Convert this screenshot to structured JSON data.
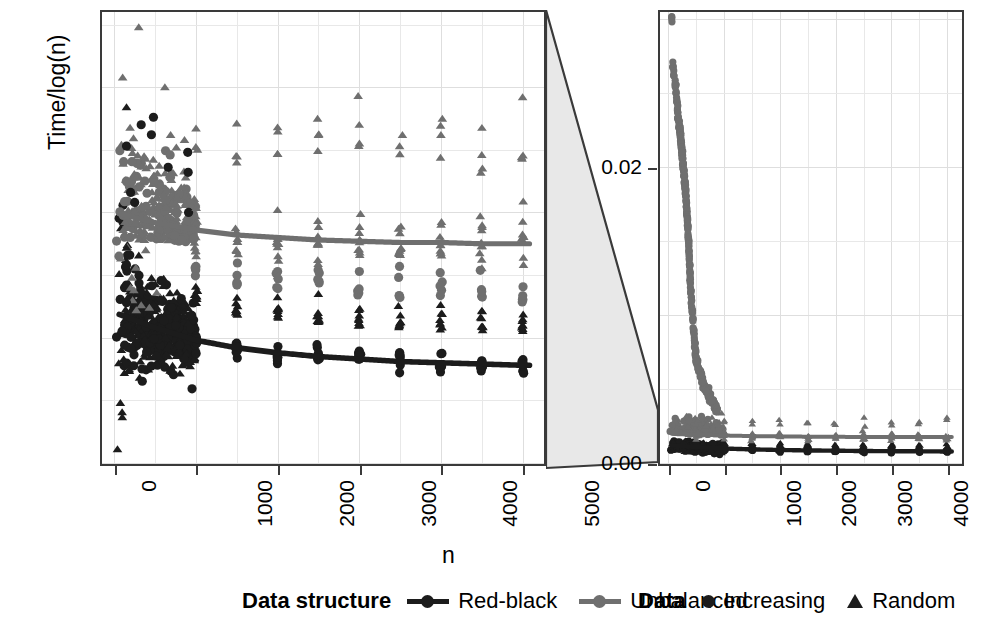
{
  "chart_data": {
    "type": "scatter",
    "title": "",
    "xlabel": "n",
    "ylabel": "Time/log(n)",
    "layout": "two-panel zoom (facet_zoom): left = magnified y-range, right = full y-range",
    "grid": true,
    "legend_position": "bottom",
    "panels": [
      {
        "name": "zoomed",
        "position": "left",
        "xlim": [
          -150,
          5250
        ],
        "ylim": [
          0,
          0.0036
        ],
        "xticks": [
          0,
          1000,
          2000,
          3000,
          4000,
          5000
        ],
        "xticklabels": [
          "0",
          "1000",
          "2000",
          "3000",
          "4000",
          "5000"
        ],
        "yticks": [],
        "yticklabels": []
      },
      {
        "name": "full",
        "position": "right",
        "xlim": [
          -150,
          5250
        ],
        "ylim": [
          0,
          0.0305
        ],
        "xticks": [
          0,
          1000,
          2000,
          3000,
          4000,
          5000
        ],
        "xticklabels": [
          "0",
          "1000",
          "2000",
          "3000",
          "4000",
          "5000"
        ],
        "yticks": [
          0.0,
          0.02
        ],
        "yticklabels": [
          "0.00",
          "0.02"
        ],
        "zoom_band": [
          0,
          0.0036
        ]
      }
    ],
    "series": [
      {
        "name": "Red-black / Increasing",
        "data_structure": "Red-black",
        "data": "Increasing",
        "color": "#1c1c1c",
        "marker": "circle",
        "trend_x": [
          0,
          500,
          1000,
          1500,
          2000,
          2500,
          3000,
          3500,
          4000,
          4500,
          5000
        ],
        "trend_y": [
          0.0012,
          0.00108,
          0.00098,
          0.00092,
          0.00088,
          0.00085,
          0.00083,
          0.00081,
          0.0008,
          0.00079,
          0.00078
        ]
      },
      {
        "name": "Red-black / Random",
        "data_structure": "Red-black",
        "data": "Random",
        "color": "#1c1c1c",
        "marker": "triangle"
      },
      {
        "name": "Unbalanced / Increasing",
        "data_structure": "Unbalanced",
        "data": "Increasing",
        "color": "#6f6f6f",
        "marker": "circle",
        "note": "in full panel this series rises steeply to ~0.030 for small n"
      },
      {
        "name": "Unbalanced / Random",
        "data_structure": "Unbalanced",
        "data": "Random",
        "color": "#6f6f6f",
        "marker": "triangle",
        "trend_x": [
          0,
          500,
          1000,
          1500,
          2000,
          2500,
          3000,
          3500,
          4000,
          4500,
          5000
        ],
        "trend_y": [
          0.002,
          0.00192,
          0.00186,
          0.00182,
          0.0018,
          0.00178,
          0.00177,
          0.00176,
          0.00176,
          0.00175,
          0.00175
        ]
      }
    ],
    "unbalanced_increasing_full_panel": {
      "x": [
        60,
        80,
        100,
        120,
        140,
        150,
        160,
        170,
        180,
        190,
        200,
        205,
        210,
        215,
        220,
        225,
        230,
        235,
        240,
        245,
        250,
        255,
        260,
        265,
        270,
        275,
        280,
        285,
        290,
        295,
        300,
        305,
        310,
        315,
        320,
        325,
        330,
        335,
        340,
        345,
        350,
        355,
        360,
        365,
        370,
        375,
        380,
        385,
        390,
        395,
        400,
        410,
        420,
        430,
        440,
        450,
        460,
        470,
        480,
        490,
        500
      ],
      "y": [
        0.03,
        0.0268,
        0.0262,
        0.0255,
        0.0252,
        0.0243,
        0.024,
        0.0236,
        0.0233,
        0.023,
        0.0228,
        0.0226,
        0.0224,
        0.0222,
        0.022,
        0.0218,
        0.0216,
        0.0214,
        0.0212,
        0.021,
        0.0208,
        0.0206,
        0.0204,
        0.0202,
        0.02,
        0.0198,
        0.0196,
        0.0194,
        0.0192,
        0.019,
        0.0188,
        0.0186,
        0.0183,
        0.018,
        0.0177,
        0.0174,
        0.0171,
        0.0168,
        0.0165,
        0.0162,
        0.0159,
        0.0155,
        0.0151,
        0.0147,
        0.0143,
        0.0139,
        0.0135,
        0.0131,
        0.0127,
        0.0123,
        0.0119,
        0.0113,
        0.0107,
        0.0101,
        0.0096,
        0.0091,
        0.0086,
        0.0082,
        0.0078,
        0.0074,
        0.007
      ]
    },
    "x_cluster_values": [
      500,
      1000,
      1500,
      2000,
      2500,
      3000,
      3500,
      4000,
      4500,
      5000
    ]
  },
  "legends": [
    {
      "title": "Data structure",
      "keys": [
        {
          "label": "Red-black",
          "glyph": "line-with-circle",
          "color": "#1c1c1c"
        },
        {
          "label": "Unbalanced",
          "glyph": "line-with-circle",
          "color": "#6f6f6f"
        }
      ]
    },
    {
      "title": "Data",
      "keys": [
        {
          "label": "Increasing",
          "glyph": "circle-icon",
          "color": "#1c1c1c"
        },
        {
          "label": "Random",
          "glyph": "triangle-icon",
          "color": "#1c1c1c"
        }
      ]
    }
  ],
  "colors": {
    "red_black": "#1c1c1c",
    "unbalanced": "#6f6f6f",
    "panel_border": "#3a3a3a",
    "grid": "#e8e8e8",
    "zoom_shade": "#e3e3e3"
  }
}
